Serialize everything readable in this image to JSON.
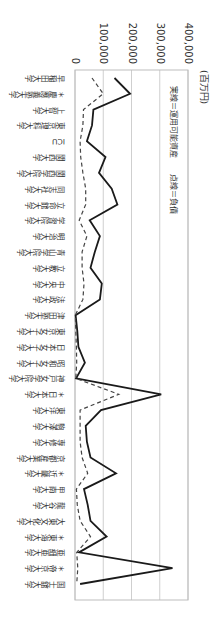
{
  "chart_data": {
    "type": "line",
    "title": "",
    "unit_label": "(百万円)",
    "legend": "実線＝運用可能資産　　点線＝負債",
    "xlabel": "",
    "ylabel": "(百万円)",
    "ylim": [
      0,
      400000
    ],
    "yticks": [
      "0",
      "100,000",
      "200,000",
      "300,000",
      "400,000"
    ],
    "grid": true,
    "legend_position": "top-inside",
    "categories": [
      "早稲田大学",
      "＊慶應義塾大学",
      "上智大学",
      "東京理科大学",
      "ICU",
      "関西大学",
      "関西学院大学",
      "同志社大学",
      "立命館大学",
      "学習院大学",
      "明治大学",
      "青山学院大学",
      "立教大学",
      "中央大学",
      "法政大学",
      "津田塾大学",
      "東京女子大学",
      "日本女子大学",
      "昭和女子大学",
      "神戸女学院大学",
      "＊日本大学",
      "東洋大学",
      "駒澤大学",
      "専修大学",
      "京都産業大学",
      "＊近畿大学",
      "甲南大学",
      "龍谷大学",
      "大東文化大学",
      "＊東海大学",
      "亜細亜大学",
      "＊帝京大学",
      "国士舘大学"
    ],
    "series": [
      {
        "name": "運用可能資産",
        "style": "solid",
        "values": [
          140000,
          195000,
          65000,
          60000,
          42000,
          108000,
          85000,
          130000,
          150000,
          52000,
          88000,
          70000,
          55000,
          95000,
          88000,
          2000,
          8000,
          12000,
          35000,
          4000,
          305000,
          92000,
          38000,
          42000,
          55000,
          145000,
          32000,
          45000,
          55000,
          112000,
          14000,
          345000,
          18000
        ]
      },
      {
        "name": "負債",
        "style": "dashed",
        "values": [
          60000,
          100000,
          30000,
          28000,
          18000,
          20000,
          28000,
          38000,
          38000,
          15000,
          42000,
          25000,
          25000,
          32000,
          28000,
          1000,
          3000,
          5000,
          6000,
          3000,
          155000,
          18000,
          18000,
          18000,
          25000,
          45000,
          5000,
          8000,
          18000,
          55000,
          6000,
          10000,
          6000
        ]
      }
    ]
  }
}
